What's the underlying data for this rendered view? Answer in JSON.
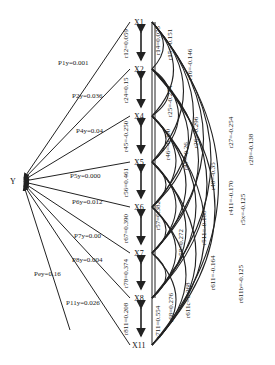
{
  "diagram": {
    "type": "path-analysis",
    "target_node": "Y",
    "nodes": [
      {
        "id": "X1",
        "label": "X1",
        "y": 22
      },
      {
        "id": "X2",
        "label": "X2",
        "y": 69
      },
      {
        "id": "X4",
        "label": "X4",
        "y": 116
      },
      {
        "id": "X5",
        "label": "X5",
        "y": 162
      },
      {
        "id": "X6",
        "label": "X6",
        "y": 207
      },
      {
        "id": "X7",
        "label": "X7",
        "y": 253
      },
      {
        "id": "X8",
        "label": "X8",
        "y": 298
      },
      {
        "id": "X11",
        "label": "X11",
        "y": 345
      }
    ],
    "path_coefficients": [
      {
        "label": "P1y=0.001",
        "from": "X1",
        "value": 0.001
      },
      {
        "label": "P2y=0.036",
        "from": "X2",
        "value": 0.036
      },
      {
        "label": "P4y=0.04",
        "from": "X4",
        "value": 0.04
      },
      {
        "label": "P5y=0.000",
        "from": "X5",
        "value": 0.0
      },
      {
        "label": "P6y=0.012",
        "from": "X6",
        "value": 0.012
      },
      {
        "label": "P7y=0.00",
        "from": "X7",
        "value": 0.0
      },
      {
        "label": "P8y=0.004",
        "from": "X8",
        "value": 0.004
      },
      {
        "label": "P11y=0.026",
        "from": "X11",
        "value": 0.026
      },
      {
        "label": "Pey=0.16",
        "from": "e",
        "value": 0.16
      }
    ],
    "adjacent_correlations": [
      {
        "label": "r12=0.059",
        "pair": [
          "X1",
          "X2"
        ]
      },
      {
        "label": "r24=0.15",
        "pair": [
          "X2",
          "X4"
        ]
      },
      {
        "label": "r45=-0.250",
        "pair": [
          "X4",
          "X5"
        ]
      },
      {
        "label": "r56=0.461",
        "pair": [
          "X5",
          "X6"
        ]
      },
      {
        "label": "r67=0.390",
        "pair": [
          "X6",
          "X7"
        ]
      },
      {
        "label": "r78=0.374",
        "pair": [
          "X7",
          "X8"
        ]
      },
      {
        "label": "r811=0.208",
        "pair": [
          "X8",
          "X11"
        ]
      }
    ],
    "arc_correlations": [
      {
        "label": "r14=0.075"
      },
      {
        "label": "r15=-0.151"
      },
      {
        "label": "r16=-0.146"
      },
      {
        "label": "r25=-0.254"
      },
      {
        "label": "r26=-0.296"
      },
      {
        "label": "r27=-0.254"
      },
      {
        "label": "r28=-0.138"
      },
      {
        "label": "r46=-0.300"
      },
      {
        "label": "r47=-0.26"
      },
      {
        "label": "r48=-0.35"
      },
      {
        "label": "r411=-0.170"
      },
      {
        "label": "r5x=-0.125"
      },
      {
        "label": "r57=0.382"
      },
      {
        "label": "r58=0.272"
      },
      {
        "label": "r511=-0.188"
      },
      {
        "label": "r611=-0.164"
      },
      {
        "label": "r611b=-0.125"
      },
      {
        "label": "r68=0.276"
      },
      {
        "label": "r611c=0.268"
      },
      {
        "label": "r711=0.554"
      }
    ]
  }
}
